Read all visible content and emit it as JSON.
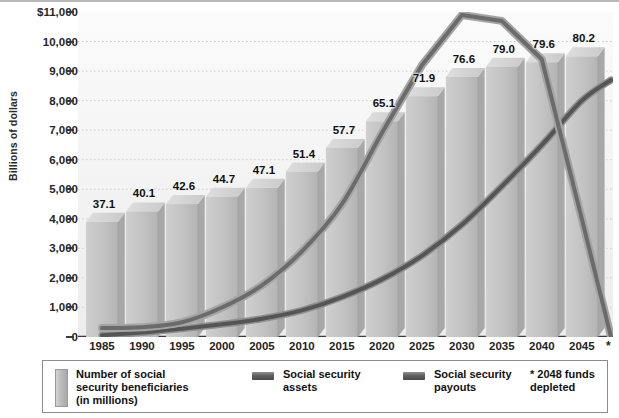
{
  "axis": {
    "y_title": "Billions of dollars",
    "y_ticks": [
      "$11,000",
      "10,000",
      "9,000",
      "8,000",
      "7,000",
      "6,000",
      "5,000",
      "4,000",
      "3,000",
      "2,000",
      "1,000",
      "0"
    ],
    "x_ticks": [
      "1985",
      "1990",
      "1995",
      "2000",
      "2005",
      "2010",
      "2015",
      "2020",
      "2025",
      "2030",
      "2035",
      "2040",
      "2045"
    ],
    "x_star": "*"
  },
  "legend": {
    "bars_label": "Number of social\nsecurity beneficiaries\n(in millions)",
    "assets_label": "Social security\nassets",
    "payouts_label": "Social security\npayouts",
    "note": "* 2048 funds\n   depleted"
  },
  "colors": {
    "bar_face": "#c2c2c2",
    "bar_top": "#d8d8d8",
    "bar_side": "#a8a8a8",
    "assets_line": "#7d7d7d",
    "payouts_line": "#4f4f4f",
    "grid": "#cccccc",
    "axis": "#3a3a3a",
    "plot_bg": "#f4f4f4"
  },
  "chart_data": {
    "type": "bar",
    "title": "",
    "subtitle": "",
    "xlabel": "",
    "ylabel": "Billions of dollars",
    "ylim": [
      0,
      11000
    ],
    "grid": true,
    "legend_position": "bottom",
    "categories": [
      "1985",
      "1990",
      "1995",
      "2000",
      "2005",
      "2010",
      "2015",
      "2020",
      "2025",
      "2030",
      "2035",
      "2040",
      "2045"
    ],
    "series": [
      {
        "name": "Number of social security beneficiaries (in millions)",
        "type": "bar",
        "axis": "secondary-implied",
        "values": [
          37.1,
          40.1,
          42.6,
          44.7,
          47.1,
          51.4,
          57.7,
          65.1,
          71.9,
          76.6,
          79.0,
          79.6,
          80.2
        ],
        "data_labels": [
          "37.1",
          "40.1",
          "42.6",
          "44.7",
          "47.1",
          "51.4",
          "57.7",
          "65.1",
          "71.9",
          "76.6",
          "79.0",
          "79.6",
          "80.2"
        ],
        "bar_top_values_in_billions": [
          3900,
          4250,
          4500,
          4750,
          5050,
          5600,
          6400,
          7300,
          8150,
          8800,
          9150,
          9300,
          9500
        ]
      },
      {
        "name": "Social security assets",
        "type": "line",
        "ylabel": "Billions of dollars",
        "x": [
          "1985",
          "1990",
          "1995",
          "2000",
          "2005",
          "2010",
          "2015",
          "2020",
          "2025",
          "2030",
          "2035",
          "2040",
          "2045",
          "2048"
        ],
        "values": [
          300,
          330,
          500,
          1000,
          1750,
          2900,
          4500,
          6900,
          9200,
          10900,
          10700,
          9400,
          4000,
          0
        ]
      },
      {
        "name": "Social security payouts",
        "type": "line",
        "ylabel": "Billions of dollars",
        "x": [
          "1985",
          "1990",
          "1995",
          "2000",
          "2005",
          "2010",
          "2015",
          "2020",
          "2025",
          "2030",
          "2035",
          "2040",
          "2045",
          "2048"
        ],
        "values": [
          60,
          150,
          280,
          430,
          620,
          900,
          1350,
          1950,
          2750,
          3800,
          5100,
          6500,
          8000,
          8700
        ]
      }
    ],
    "annotations": [
      "* 2048 funds depleted"
    ]
  }
}
